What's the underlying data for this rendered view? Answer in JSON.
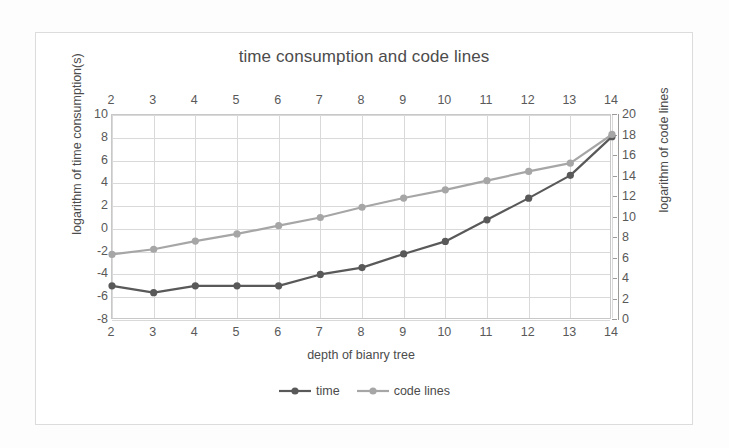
{
  "chart_data": {
    "type": "line",
    "title": "time consumption and code lines",
    "xlabel": "depth of bianry tree",
    "ylabel": "logarithm of time consumption(s)",
    "y2label": "logarithm of code lines",
    "x": [
      2,
      3,
      4,
      5,
      6,
      7,
      8,
      9,
      10,
      11,
      12,
      13,
      14
    ],
    "xlim": [
      2,
      14
    ],
    "ylim": [
      -8,
      10
    ],
    "y2lim": [
      0,
      20
    ],
    "ytick_step": 2,
    "y2tick_step": 2,
    "xticks": [
      "2",
      "3",
      "4",
      "5",
      "6",
      "7",
      "8",
      "9",
      "10",
      "11",
      "12",
      "13",
      "14"
    ],
    "yticks": [
      "10",
      "8",
      "6",
      "4",
      "2",
      "0",
      "-2",
      "-4",
      "-6",
      "-8"
    ],
    "y2ticks": [
      "20",
      "18",
      "16",
      "14",
      "12",
      "10",
      "8",
      "6",
      "4",
      "2",
      "0"
    ],
    "grid": true,
    "legend_position": "bottom",
    "xticks_top": true,
    "series": [
      {
        "name": "time",
        "axis": "left",
        "color": "#595959",
        "marker": "circle",
        "values": [
          -5.0,
          -5.6,
          -5.0,
          -5.0,
          -5.0,
          -4.0,
          -3.4,
          -2.2,
          -1.1,
          0.8,
          2.7,
          4.7,
          8.1
        ]
      },
      {
        "name": "code lines",
        "axis": "right",
        "color": "#a6a6a6",
        "marker": "circle",
        "values": [
          6.4,
          6.9,
          7.7,
          8.4,
          9.2,
          10.0,
          11.0,
          11.9,
          12.7,
          13.6,
          14.5,
          15.3,
          18.1
        ]
      }
    ]
  },
  "legend": {
    "items": [
      {
        "label": "time",
        "color": "#595959"
      },
      {
        "label": "code lines",
        "color": "#a6a6a6"
      }
    ]
  }
}
